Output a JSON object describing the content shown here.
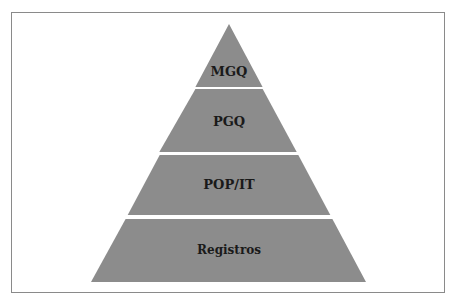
{
  "diagram": {
    "type": "pyramid",
    "fill_color": "#8c8c8c",
    "border_color": "#8a8a8a",
    "levels": [
      {
        "label": "MGQ"
      },
      {
        "label": "PGQ"
      },
      {
        "label": "POP/IT"
      },
      {
        "label": "Registros"
      }
    ]
  }
}
